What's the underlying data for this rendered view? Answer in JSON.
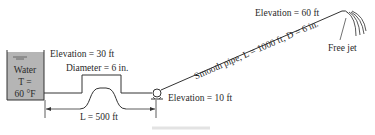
{
  "diagram": {
    "tank": {
      "line1": "Water",
      "line2": "T =",
      "line3": "60 °F",
      "fill_color": "#b5b5b5"
    },
    "labels": {
      "tank_elevation": "Elevation = 30 ft",
      "diameter": "Diameter = 6 in.",
      "length_first": "L = 500 ft",
      "pump_elevation": "Elevation = 10 ft",
      "smooth_pipe": "Smooth pipe, L = 1000 ft, D = 6 in.",
      "outlet_elevation": "Elevation = 60 ft",
      "free_jet": "Free jet"
    },
    "line_color": "#333333"
  }
}
